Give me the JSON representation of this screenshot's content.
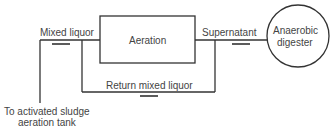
{
  "diagram": {
    "nodes": {
      "aeration": "Aeration",
      "digester_line1": "Anaerobic",
      "digester_line2": "digester"
    },
    "labels": {
      "mixed_liquor": "Mixed liquor",
      "supernatant": "Supernatant",
      "return": "Return mixed liquor",
      "dest_line1": "To activated sludge",
      "dest_line2": "aeration tank"
    }
  }
}
